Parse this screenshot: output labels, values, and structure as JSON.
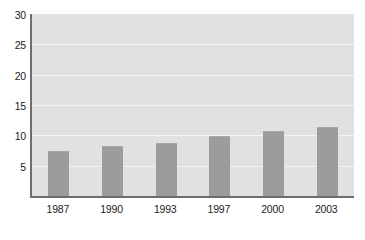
{
  "chart_data": {
    "type": "bar",
    "title": "",
    "subtitle": "",
    "xlabel": "",
    "ylabel": "",
    "categories": [
      "1987",
      "1990",
      "1993",
      "1997",
      "2000",
      "2003"
    ],
    "values": [
      7.5,
      8.2,
      8.7,
      9.9,
      10.7,
      11.4
    ],
    "series": [
      {
        "name": "",
        "values": [
          7.5,
          8.2,
          8.7,
          9.9,
          10.7,
          11.4
        ]
      }
    ],
    "ylim": [
      0,
      30
    ],
    "yticks": [
      5,
      10,
      15,
      20,
      25,
      30
    ],
    "ytick_labels": [
      "5",
      "10",
      "15",
      "20",
      "25",
      "30"
    ],
    "xtick_labels": [
      "1987",
      "1990",
      "1993",
      "1997",
      "2000",
      "2003"
    ],
    "grid": true,
    "grid_axis": "y",
    "legend": false,
    "legend_position": "none",
    "annotations": []
  },
  "style": {
    "page_background": "#ffffff",
    "plot_background": "#e1e1e1",
    "bar_color": "#9c9c9c",
    "gridline_color": "#f4f4f4",
    "axis_color": "#6e6e6e",
    "tick_label_color": "#1c1c1c"
  }
}
